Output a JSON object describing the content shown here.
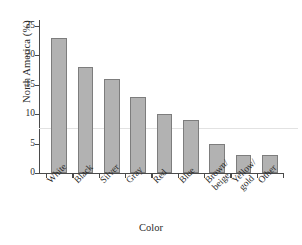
{
  "chart_data": {
    "type": "bar",
    "title": "",
    "xlabel": "Color",
    "ylabel": "North America (%)",
    "categories": [
      "White",
      "Black",
      "Silver",
      "Gray",
      "Red",
      "Blue",
      "Brown/beige",
      "Yellow/gold",
      "Other"
    ],
    "values": [
      23,
      18,
      16,
      13,
      10,
      9,
      5,
      3,
      3
    ],
    "ylim": [
      0,
      26
    ],
    "yticks": [
      0,
      5,
      10,
      15,
      20,
      25
    ],
    "ytick_labels": [
      "0",
      "5",
      "10",
      "15",
      "20",
      "25"
    ],
    "grid": false,
    "legend": null,
    "annotations": [
      {
        "name": "reference-line",
        "type": "hline",
        "value": 7.6,
        "color": "#e2e2e2"
      }
    ],
    "bar_color": "#b2b2b2",
    "bar_edge_color": "#7d7d7d",
    "axis_color": "#4a4a4a"
  },
  "xtick_label_lines": [
    [
      "White",
      ""
    ],
    [
      "Black",
      ""
    ],
    [
      "Silver",
      ""
    ],
    [
      "Gray",
      ""
    ],
    [
      "Red",
      ""
    ],
    [
      "Blue",
      ""
    ],
    [
      "Brown/",
      "beige"
    ],
    [
      "Yellow/",
      "gold"
    ],
    [
      "Other",
      ""
    ]
  ]
}
